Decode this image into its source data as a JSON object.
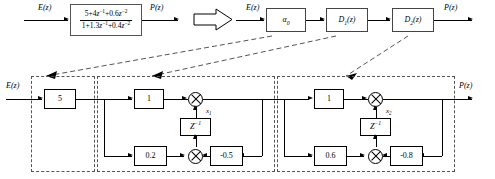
{
  "diagram": {
    "top_left": {
      "input_label": "E(z)",
      "output_label": "P(z)",
      "transfer_function": {
        "numerator": "5+4z^-1+0.6z^-2",
        "denominator": "1+1.3z^-1+0.4z^-2",
        "numerator_parts": [
          "5+4",
          "z",
          "-1",
          "+0.6",
          "z",
          "-2"
        ],
        "denominator_parts": [
          "1+1.3",
          "z",
          "-1",
          "+0.4",
          "z",
          "-2"
        ]
      },
      "convert_arrow": "block-arrow-right"
    },
    "top_right": {
      "input_label": "E(z)",
      "output_label": "P(z)",
      "blocks": [
        {
          "name": "alpha0",
          "label": "a",
          "subscript": "0"
        },
        {
          "name": "D1",
          "label": "D",
          "subscript": "1",
          "suffix": "(z)"
        },
        {
          "name": "D2",
          "label": "D",
          "subscript": "2",
          "suffix": "(z)"
        }
      ]
    },
    "bottom": {
      "input_label": "E(z)",
      "output_label": "P(z)",
      "sections": [
        {
          "name": "gain-section",
          "gain": "5"
        },
        {
          "name": "stage-1",
          "forward_gain": "1",
          "feedforward_gain": "0.2",
          "feedback_gain": "-0.5",
          "delay": "Z",
          "delay_exponent": "-1",
          "state_label": "x",
          "state_subscript": "1"
        },
        {
          "name": "stage-2",
          "forward_gain": "1",
          "feedforward_gain": "0.6",
          "feedback_gain": "-0.8",
          "delay": "Z",
          "delay_exponent": "-1",
          "state_label": "x",
          "state_subscript": "2"
        }
      ]
    },
    "colors": {
      "line": "#000000",
      "dashed_guide": "#555555",
      "background": "#ffffff"
    }
  }
}
